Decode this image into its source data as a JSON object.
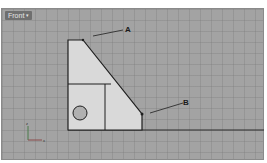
{
  "viewport": {
    "label": "Front",
    "caret": "▾",
    "background": "#a3a3a3"
  },
  "drawing": {
    "part_fill": "#d9d9d9",
    "line_color": "#1e1e1e",
    "callouts": [
      {
        "label": "A"
      },
      {
        "label": "B"
      }
    ]
  },
  "axes": {
    "z": "z",
    "x": "x"
  }
}
